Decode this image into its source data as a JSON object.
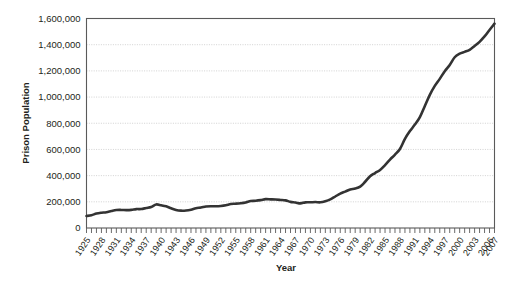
{
  "chart_data": {
    "type": "line",
    "title": "",
    "xlabel": "Year",
    "ylabel": "Prison Population",
    "xlim": [
      1925,
      2007
    ],
    "ylim": [
      0,
      1600000
    ],
    "grid": true,
    "legend": "none",
    "y_ticks": [
      0,
      200000,
      400000,
      600000,
      800000,
      1000000,
      1200000,
      1400000,
      1600000
    ],
    "y_tick_labels": [
      "0",
      "200,000",
      "400,000",
      "600,000",
      "800,000",
      "1,000,000",
      "1,200,000",
      "1,400,000",
      "1,600,000"
    ],
    "x_tick_labels": [
      "1925",
      "1928",
      "1931",
      "1934",
      "1937",
      "1940",
      "1943",
      "1946",
      "1949",
      "1952",
      "1955",
      "1958",
      "1961",
      "1964",
      "1967",
      "1970",
      "1973",
      "1976",
      "1979",
      "1982",
      "1985",
      "1988",
      "1991",
      "1994",
      "1997",
      "2000",
      "2003",
      "2006",
      "2007"
    ],
    "series": [
      {
        "name": "Prison Population",
        "color": "#333333",
        "x": [
          1925,
          1926,
          1927,
          1928,
          1929,
          1930,
          1931,
          1932,
          1933,
          1934,
          1935,
          1936,
          1937,
          1938,
          1939,
          1940,
          1941,
          1942,
          1943,
          1944,
          1945,
          1946,
          1947,
          1948,
          1949,
          1950,
          1951,
          1952,
          1953,
          1954,
          1955,
          1956,
          1957,
          1958,
          1959,
          1960,
          1961,
          1962,
          1963,
          1964,
          1965,
          1966,
          1967,
          1968,
          1969,
          1970,
          1971,
          1972,
          1973,
          1974,
          1975,
          1976,
          1977,
          1978,
          1979,
          1980,
          1981,
          1982,
          1983,
          1984,
          1985,
          1986,
          1987,
          1988,
          1989,
          1990,
          1991,
          1992,
          1993,
          1994,
          1995,
          1996,
          1997,
          1998,
          1999,
          2000,
          2001,
          2002,
          2003,
          2004,
          2005,
          2006,
          2007
        ],
        "y": [
          91669,
          97991,
          109983,
          116390,
          120496,
          129453,
          137082,
          137997,
          136810,
          138316,
          144180,
          145038,
          152741,
          160285,
          179818,
          173706,
          165439,
          150384,
          137220,
          132456,
          133649,
          140079,
          151304,
          155977,
          163749,
          166123,
          165680,
          168233,
          173579,
          182901,
          185780,
          189565,
          195414,
          205643,
          208105,
          212953,
          220149,
          218830,
          217283,
          214336,
          210895,
          199654,
          194896,
          187914,
          196007,
          196429,
          198061,
          196092,
          204211,
          218466,
          240593,
          262833,
          278141,
          294396,
          301470,
          315974,
          353167,
          395516,
          419820,
          443398,
          480568,
          522084,
          560812,
          603732,
          680907,
          739980,
          789610,
          846277,
          932074,
          1016691,
          1085022,
          1138984,
          1197590,
          1245402,
          1304074,
          1331278,
          1345217,
          1360710,
          1390279,
          1421911,
          1462866,
          1512576,
          1560600
        ]
      }
    ]
  }
}
